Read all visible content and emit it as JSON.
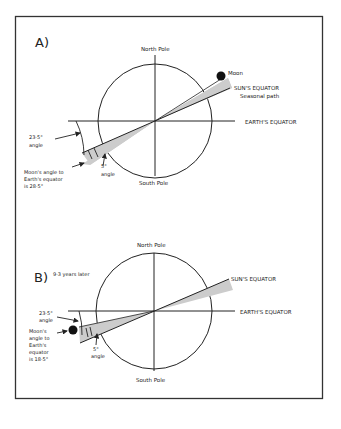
{
  "panel_a": {
    "label": "A)",
    "north": "North Pole",
    "south": "South Pole",
    "moon": "Moon",
    "sun_eq": "SUN'S EQUATOR",
    "seasonal": "Seasonal path",
    "earth_eq": "EARTH'S EQUATOR",
    "angle235_1": "23·5°",
    "angle235_2": "angle",
    "angle5_1": "5°",
    "angle5_2": "angle",
    "moon_angle_1": "Moon's angle to",
    "moon_angle_2": "Earth's equator",
    "moon_angle_3": "is 28·5°"
  },
  "panel_b": {
    "label": "B)",
    "sublabel": "9·3 years later",
    "north": "North Pole",
    "south": "South Pole",
    "sun_eq": "SUN'S EQUATOR",
    "earth_eq": "EARTH'S EQUATOR",
    "angle235_1": "23·5°",
    "angle235_2": "angle",
    "angle5_1": "5°",
    "angle5_2": "angle",
    "moon_angle_1": "Moon's",
    "moon_angle_2": "angle to",
    "moon_angle_3": "Earth's",
    "moon_angle_4": "equator",
    "moon_angle_5": "is 18·5°"
  }
}
